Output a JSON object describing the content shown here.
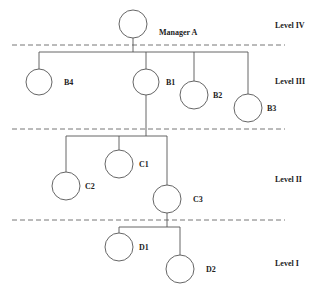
{
  "diagram": {
    "type": "organizational-hierarchy",
    "levels": [
      {
        "label": "Level IV",
        "y": 28
      },
      {
        "label": "Level III",
        "y": 84
      },
      {
        "label": "Level II",
        "y": 182
      },
      {
        "label": "Level I",
        "y": 266
      }
    ],
    "dividers_y": [
      45,
      129,
      220
    ],
    "nodes": [
      {
        "id": "manager-a",
        "label": "Manager A",
        "cx": 133,
        "cy": 24,
        "r": 14,
        "lx": 159,
        "ly": 35
      },
      {
        "id": "b4",
        "label": "B4",
        "cx": 39,
        "cy": 82,
        "r": 13,
        "lx": 64,
        "ly": 85
      },
      {
        "id": "b1",
        "label": "B1",
        "cx": 146,
        "cy": 82,
        "r": 13,
        "lx": 166,
        "ly": 85
      },
      {
        "id": "b2",
        "label": "B2",
        "cx": 194,
        "cy": 95,
        "r": 14,
        "lx": 213,
        "ly": 98
      },
      {
        "id": "b3",
        "label": "B3",
        "cx": 248,
        "cy": 108,
        "r": 14,
        "lx": 267,
        "ly": 111
      },
      {
        "id": "c1",
        "label": "C1",
        "cx": 119,
        "cy": 164,
        "r": 14,
        "lx": 139,
        "ly": 167
      },
      {
        "id": "c2",
        "label": "C2",
        "cx": 66,
        "cy": 186,
        "r": 14,
        "lx": 85,
        "ly": 189
      },
      {
        "id": "c3",
        "label": "C3",
        "cx": 167,
        "cy": 199,
        "r": 14,
        "lx": 193,
        "ly": 202
      },
      {
        "id": "d1",
        "label": "D1",
        "cx": 119,
        "cy": 247,
        "r": 14,
        "lx": 139,
        "ly": 250
      },
      {
        "id": "d2",
        "label": "D2",
        "cx": 180,
        "cy": 269,
        "r": 14,
        "lx": 206,
        "ly": 272
      }
    ],
    "edges": [
      {
        "from": "manager-a",
        "to": [
          "b4",
          "b1",
          "b2",
          "b3"
        ]
      },
      {
        "from": "b1",
        "to": [
          "c2",
          "c1",
          "c3"
        ]
      },
      {
        "from": "c3",
        "to": [
          "d1",
          "d2"
        ]
      }
    ]
  }
}
